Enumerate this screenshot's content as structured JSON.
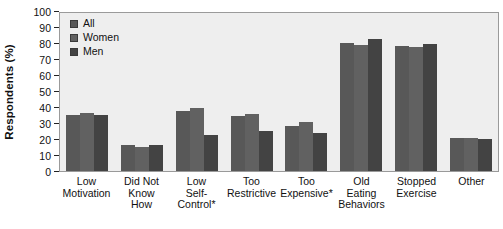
{
  "chart_data": {
    "type": "bar",
    "title": "",
    "subtitle": "",
    "xlabel": "",
    "ylabel": "Respondents (%)",
    "ylim": [
      0,
      100
    ],
    "ytick_step": 10,
    "grid": false,
    "legend_position": "top-left",
    "categories": [
      "Low\nMotivation",
      "Did Not\nKnow\nHow",
      "Low\nSelf-\nControl*",
      "Too\nRestrictive",
      "Too\nExpensive*",
      "Old\nEating\nBehaviors",
      "Stopped\nExercise",
      "Other"
    ],
    "ytick_labels": [
      "100",
      "90",
      "80",
      "70",
      "60",
      "50",
      "40",
      "30",
      "20",
      "10",
      "0"
    ],
    "series": [
      {
        "name": "All",
        "color": "#585858",
        "values": [
          35.5,
          16.5,
          38,
          35,
          28.5,
          81,
          79,
          21
        ]
      },
      {
        "name": "Women",
        "color": "#616161",
        "values": [
          37,
          15,
          40,
          36,
          31,
          80,
          78.5,
          21
        ]
      },
      {
        "name": "Men",
        "color": "#434343",
        "values": [
          35.5,
          16.5,
          22.5,
          25.5,
          24,
          83.5,
          80.5,
          20.5
        ]
      }
    ],
    "annotations": [
      "* indicates significant difference between women and men"
    ]
  },
  "legend": {
    "items": [
      {
        "label": "All",
        "color": "#585858"
      },
      {
        "label": "Women",
        "color": "#616161"
      },
      {
        "label": "Men",
        "color": "#434343"
      }
    ]
  },
  "colors": {
    "plot_background": "#eeeeee",
    "plot_border": "#9a9a9a",
    "page_background": "#ffffff",
    "text": "#111111"
  }
}
